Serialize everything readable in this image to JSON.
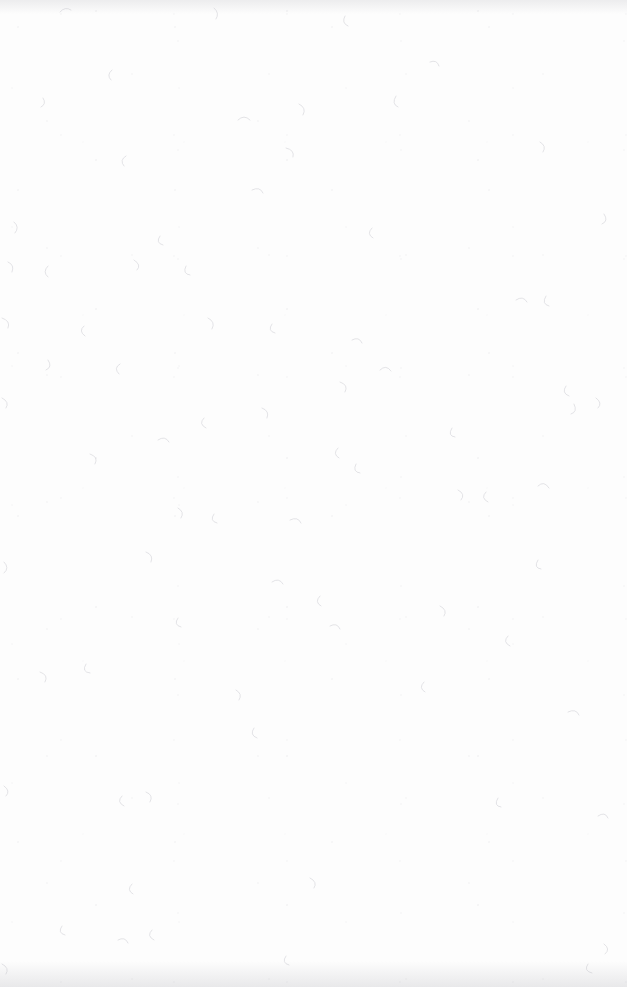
{
  "page": {
    "kind": "blank-scanned-page",
    "width": 627,
    "height": 987,
    "background_color": "#fdfdfd",
    "speckle_color": "#b9b9c2",
    "edge_shadow_color": "#96969e",
    "text_content": "",
    "has_text": false,
    "has_figures": false,
    "has_ui_chrome": false
  }
}
